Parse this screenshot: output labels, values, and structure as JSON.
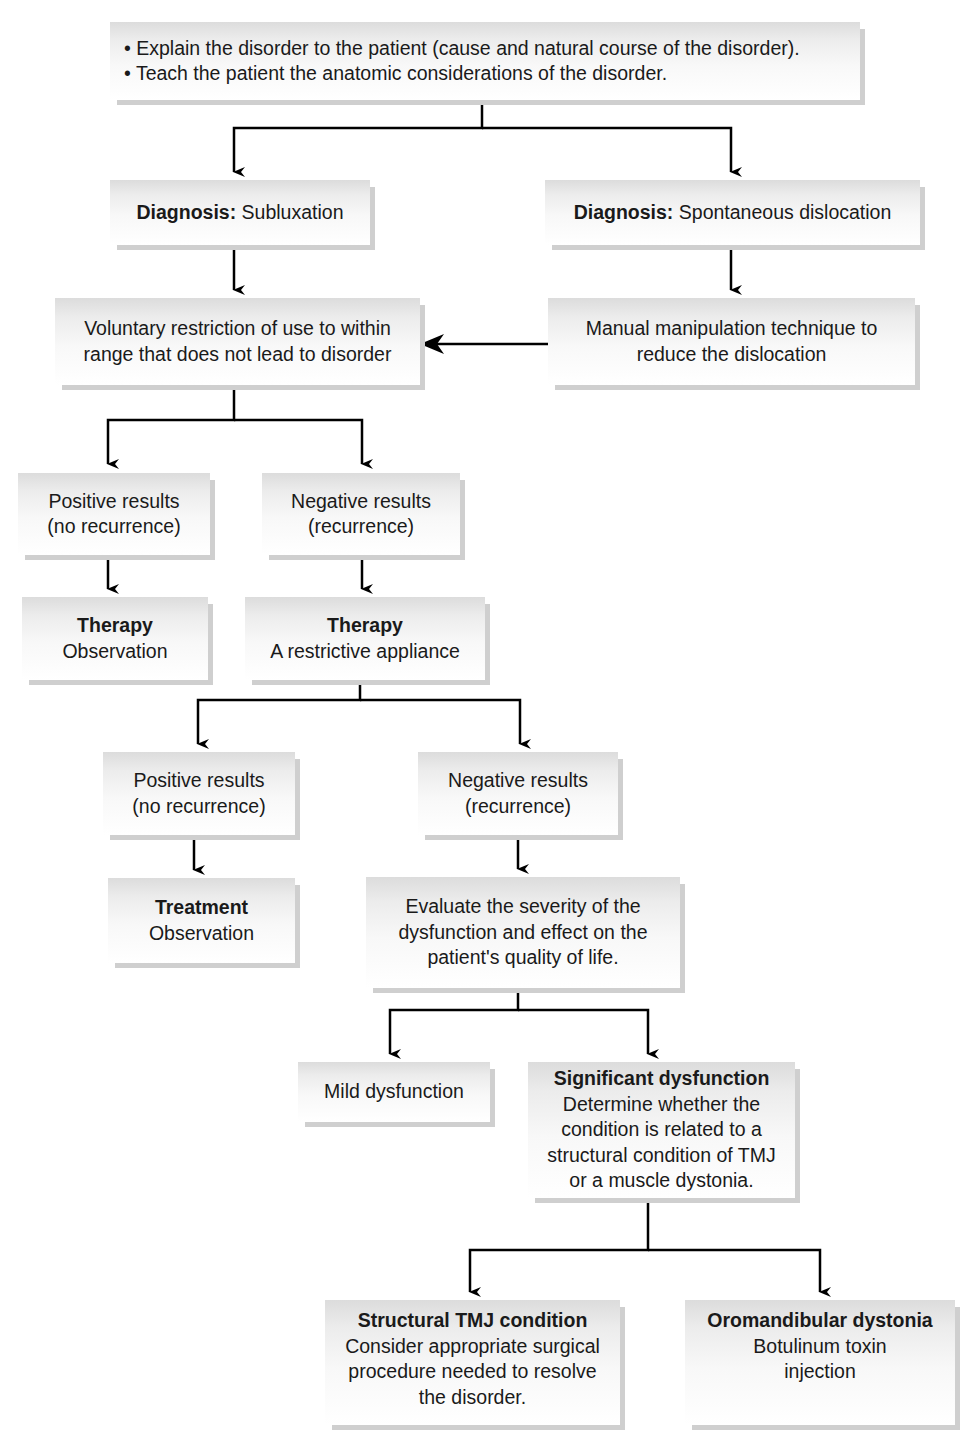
{
  "diagram": {
    "intro": {
      "bullets": [
        "• Explain the disorder to the patient (cause and natural course of the disorder).",
        "• Teach the patient the anatomic considerations of the disorder."
      ]
    },
    "diag_sub": {
      "label": "Diagnosis:",
      "value": " Subluxation"
    },
    "diag_dis": {
      "label": "Diagnosis:",
      "value": " Spontaneous dislocation"
    },
    "voluntary": {
      "lines": [
        "Voluntary restriction of use to within",
        "range that does not lead to disorder"
      ]
    },
    "manual": {
      "lines": [
        "Manual manipulation technique to",
        "reduce the dislocation"
      ]
    },
    "pos1": {
      "lines": [
        "Positive results",
        "(no recurrence)"
      ]
    },
    "neg1": {
      "lines": [
        "Negative results",
        "(recurrence)"
      ]
    },
    "therapy_obs": {
      "title": "Therapy",
      "text": "Observation"
    },
    "therapy_app": {
      "title": "Therapy",
      "text": "A restrictive appliance"
    },
    "pos2": {
      "lines": [
        "Positive results",
        "(no recurrence)"
      ]
    },
    "neg2": {
      "lines": [
        "Negative results",
        "(recurrence)"
      ]
    },
    "treatment": {
      "title": "Treatment",
      "text": "Observation"
    },
    "evaluate": {
      "lines": [
        "Evaluate the severity of the",
        "dysfunction and effect on the",
        "patient's quality of life."
      ]
    },
    "mild": {
      "text": "Mild dysfunction"
    },
    "significant": {
      "title": "Significant dysfunction",
      "lines": [
        "Determine whether the",
        "condition is related to a",
        "structural condition of TMJ",
        "or a muscle dystonia."
      ]
    },
    "structural": {
      "title": "Structural TMJ condition",
      "lines": [
        "Consider appropriate surgical",
        "procedure needed to resolve",
        "the disorder."
      ]
    },
    "oromandibular": {
      "title": "Oromandibular dystonia",
      "lines": [
        "Botulinum toxin",
        "injection"
      ]
    }
  },
  "colors": {
    "box_top": "#dcdcdc",
    "box_bottom": "#ffffff",
    "shadow": "#cfcfcf",
    "arrow": "#000000",
    "text": "#1a1a1a"
  }
}
